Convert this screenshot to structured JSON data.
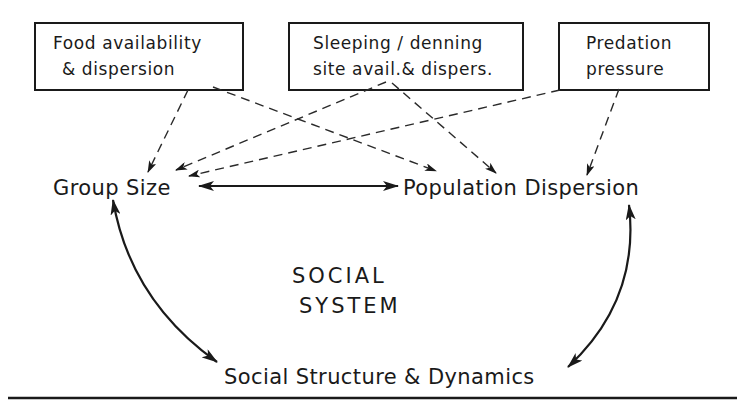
{
  "factors": [
    {
      "id": "food",
      "lines": [
        "Food availability",
        "& dispersion"
      ]
    },
    {
      "id": "sleeping",
      "lines": [
        "Sleeping / denning",
        "site avail.& dispers."
      ]
    },
    {
      "id": "predation",
      "lines": [
        "Predation",
        "pressure"
      ]
    }
  ],
  "nodes": {
    "group_size": "Group Size",
    "population_dispersion": "Population Dispersion",
    "social_structure": "Social Structure & Dynamics"
  },
  "center": {
    "line1": "SOCIAL",
    "line2": "SYSTEM"
  },
  "edges": [
    {
      "from": "food",
      "to": "group_size",
      "style": "dashed",
      "direction": "one-way"
    },
    {
      "from": "food",
      "to": "population_dispersion",
      "style": "dashed",
      "direction": "one-way"
    },
    {
      "from": "sleeping",
      "to": "group_size",
      "style": "dashed",
      "direction": "one-way"
    },
    {
      "from": "sleeping",
      "to": "population_dispersion",
      "style": "dashed",
      "direction": "one-way"
    },
    {
      "from": "predation",
      "to": "group_size",
      "style": "dashed",
      "direction": "one-way"
    },
    {
      "from": "predation",
      "to": "population_dispersion",
      "style": "dashed",
      "direction": "one-way"
    },
    {
      "from": "group_size",
      "to": "population_dispersion",
      "style": "solid",
      "direction": "two-way"
    },
    {
      "from": "group_size",
      "to": "social_structure",
      "style": "solid",
      "direction": "two-way"
    },
    {
      "from": "population_dispersion",
      "to": "social_structure",
      "style": "solid",
      "direction": "two-way"
    }
  ]
}
